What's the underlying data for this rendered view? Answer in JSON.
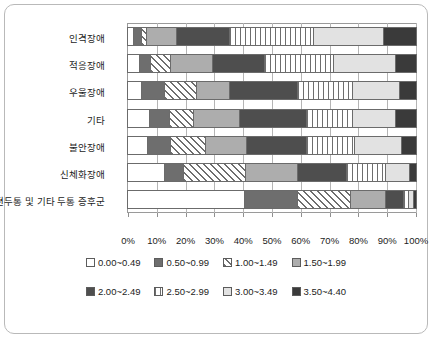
{
  "chart_data": {
    "type": "bar",
    "orientation": "horizontal",
    "stacked": true,
    "normalized_percent": true,
    "title": "",
    "xlabel": "",
    "ylabel": "",
    "xlim": [
      0,
      100
    ],
    "grid": true,
    "legend_position": "bottom",
    "xticks": [
      "0%",
      "10%",
      "20%",
      "30%",
      "40%",
      "50%",
      "60%",
      "70%",
      "80%",
      "90%",
      "100%"
    ],
    "xtick_values": [
      0,
      10,
      20,
      30,
      40,
      50,
      60,
      70,
      80,
      90,
      100
    ],
    "categories": [
      "인격장애",
      "적응장애",
      "우울장애",
      "기타",
      "불안장애",
      "신체화장애",
      "편두통 및 기타 두통 증후군"
    ],
    "series": [
      {
        "name": "0.00~0.49",
        "fill": "white",
        "color": "#ffffff",
        "values": [
          2.0,
          4.0,
          5.0,
          7.5,
          7.0,
          13.0,
          40.5
        ]
      },
      {
        "name": "0.50~0.99",
        "fill": "dark-gray",
        "color": "#6e6e6e",
        "values": [
          3.0,
          4.0,
          8.0,
          7.2,
          8.0,
          6.5,
          18.5
        ]
      },
      {
        "name": "1.00~1.49",
        "fill": "diagonal-hatch",
        "color": "#6e6e6e",
        "values": [
          1.5,
          7.0,
          11.0,
          8.3,
          12.0,
          21.5,
          18.5
        ]
      },
      {
        "name": "1.50~1.99",
        "fill": "mid-gray",
        "color": "#adadad",
        "values": [
          10.5,
          14.5,
          11.5,
          16.0,
          14.5,
          18.0,
          12.0
        ]
      },
      {
        "name": "2.00~2.49",
        "fill": "darker-gray",
        "color": "#4e4e4e",
        "values": [
          18.5,
          18.0,
          23.5,
          23.0,
          20.5,
          17.0,
          6.5
        ]
      },
      {
        "name": "2.50~2.99",
        "fill": "vertical-hatch",
        "color": "#6e6e6e",
        "values": [
          29.0,
          24.0,
          19.0,
          16.0,
          17.0,
          13.5,
          1.5
        ]
      },
      {
        "name": "3.00~3.49",
        "fill": "light-gray",
        "color": "#e2e2e2",
        "values": [
          24.5,
          21.5,
          16.5,
          15.0,
          16.0,
          8.5,
          2.0
        ]
      },
      {
        "name": "3.50~4.40",
        "fill": "near-black",
        "color": "#3a3a3a",
        "values": [
          11.0,
          7.0,
          5.5,
          7.0,
          5.0,
          2.0,
          0.5
        ]
      }
    ]
  },
  "legend": {
    "row1": [
      "0.00~0.49",
      "0.50~0.99",
      "1.00~1.49",
      "1.50~1.99"
    ],
    "row2": [
      "2.00~2.49",
      "2.50~2.99",
      "3.00~3.49",
      "3.50~4.40"
    ]
  }
}
